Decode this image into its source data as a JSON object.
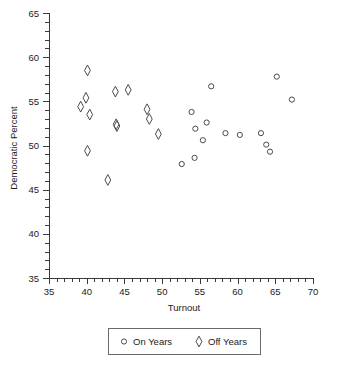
{
  "chart_data": {
    "type": "scatter",
    "title": "",
    "xlabel": "Turnout",
    "ylabel": "Democratic Percent",
    "xlim": [
      35,
      70
    ],
    "ylim": [
      35,
      65
    ],
    "xticks": [
      35,
      40,
      45,
      50,
      55,
      60,
      65,
      70
    ],
    "xtick_labels": [
      "35",
      "40",
      "45",
      "50",
      "55",
      "60",
      "65",
      "70"
    ],
    "yticks": [
      35,
      40,
      45,
      50,
      55,
      60,
      65
    ],
    "ytick_labels": [
      "35",
      "40",
      "45",
      "50",
      "55",
      "60",
      "65"
    ],
    "x_minor_tick_step": 1,
    "y_minor_tick_step": 1,
    "grid": false,
    "legend_position": "below-center",
    "series": [
      {
        "name": "On Years",
        "marker": "circle",
        "points": [
          [
            52.6,
            47.9
          ],
          [
            53.9,
            53.8
          ],
          [
            54.3,
            48.6
          ],
          [
            54.4,
            51.9
          ],
          [
            55.4,
            50.6
          ],
          [
            55.9,
            52.6
          ],
          [
            56.5,
            56.7
          ],
          [
            58.4,
            51.4
          ],
          [
            60.3,
            51.2
          ],
          [
            63.1,
            51.4
          ],
          [
            63.8,
            50.1
          ],
          [
            64.3,
            49.3
          ],
          [
            65.2,
            57.8
          ],
          [
            67.2,
            55.2
          ]
        ]
      },
      {
        "name": "Off Years",
        "marker": "diamond",
        "points": [
          [
            39.2,
            54.4
          ],
          [
            39.9,
            55.4
          ],
          [
            40.1,
            58.5
          ],
          [
            40.4,
            53.5
          ],
          [
            40.1,
            49.4
          ],
          [
            42.8,
            46.1
          ],
          [
            43.8,
            56.1
          ],
          [
            43.9,
            52.4
          ],
          [
            44.0,
            52.2
          ],
          [
            45.5,
            56.3
          ],
          [
            48.0,
            54.1
          ],
          [
            48.3,
            53.0
          ],
          [
            49.5,
            51.3
          ]
        ]
      }
    ]
  },
  "legend": {
    "entries": [
      {
        "label": "On Years",
        "marker": "circle"
      },
      {
        "label": "Off Years",
        "marker": "diamond"
      }
    ]
  }
}
